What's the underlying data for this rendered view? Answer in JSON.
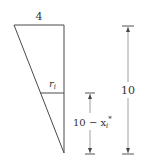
{
  "diagram": {
    "labels": {
      "top_width": "4",
      "radius": "r",
      "radius_sub": "i",
      "total_height": "10",
      "lower_height_prefix": "10 − x",
      "lower_height_sub": "i",
      "lower_height_sup": "*"
    },
    "colors": {
      "stroke": "#4a4a4a",
      "dimension_line": "#888888",
      "text": "#333333"
    }
  }
}
